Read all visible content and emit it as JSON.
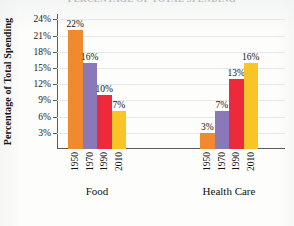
{
  "figure": {
    "cutoff_title": "PERCENTAGE OF TOTAL SPENDING",
    "y_axis_title": "Percentage of Total Spending"
  },
  "chart_data": {
    "type": "bar",
    "title": "",
    "xlabel": "",
    "ylabel": "Percentage of Total Spending",
    "ylim": [
      0,
      25
    ],
    "ytick_labels": [
      "3%",
      "6%",
      "9%",
      "12%",
      "15%",
      "18%",
      "21%",
      "24%"
    ],
    "ytick_values": [
      3,
      6,
      9,
      12,
      15,
      18,
      21,
      24
    ],
    "grid": true,
    "legend": "none",
    "categories": [
      "1950",
      "1970",
      "1990",
      "2010"
    ],
    "groups": [
      {
        "name": "Food",
        "bars": [
          {
            "category": "1950",
            "value": 22,
            "label": "22%",
            "color": "#F08A2E"
          },
          {
            "category": "1970",
            "value": 16,
            "label": "16%",
            "color": "#8A79B8"
          },
          {
            "category": "1990",
            "value": 10,
            "label": "10%",
            "color": "#ED2A3C"
          },
          {
            "category": "2010",
            "value": 7,
            "label": "7%",
            "color": "#F9C428"
          }
        ]
      },
      {
        "name": "Health Care",
        "bars": [
          {
            "category": "1950",
            "value": 3,
            "label": "3%",
            "color": "#F08A2E"
          },
          {
            "category": "1970",
            "value": 7,
            "label": "7%",
            "color": "#8A79B8"
          },
          {
            "category": "1990",
            "value": 13,
            "label": "13%",
            "color": "#ED2A3C"
          },
          {
            "category": "2010",
            "value": 16,
            "label": "16%",
            "color": "#F9C428"
          }
        ]
      }
    ],
    "series_colors": {
      "1950": "#F08A2E",
      "1970": "#8A79B8",
      "1990": "#ED2A3C",
      "2010": "#F9C428"
    }
  }
}
